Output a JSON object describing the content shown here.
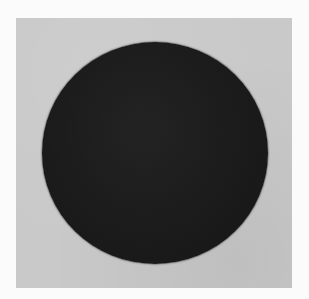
{
  "image": {
    "description": "Scanned print of a dark solid disc centered on a light gray square plate, on a white page",
    "bleed_through_text": "",
    "colors": {
      "page": "#fbfbfb",
      "plate": "#c9c9c9",
      "disc": "#1c1c1c"
    }
  }
}
